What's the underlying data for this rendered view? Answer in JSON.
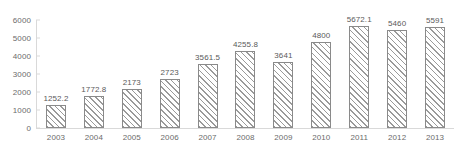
{
  "chart_data": {
    "type": "bar",
    "title": "",
    "subtitle": "",
    "xlabel": "",
    "ylabel": "",
    "categories": [
      "2003",
      "2004",
      "2005",
      "2006",
      "2007",
      "2008",
      "2009",
      "2010",
      "2011",
      "2012",
      "2013"
    ],
    "values": [
      1252.2,
      1772.8,
      2173,
      2723,
      3561.5,
      4255.8,
      3641,
      4800,
      5672.1,
      5460,
      5591
    ],
    "value_labels": [
      "1252.2",
      "1772.8",
      "2173",
      "2723",
      "3561.5",
      "4255.8",
      "3641",
      "4800",
      "5672.1",
      "5460",
      "5591"
    ],
    "series": [
      {
        "name": "",
        "values": [
          1252.2,
          1772.8,
          2173,
          2723,
          3561.5,
          4255.8,
          3641,
          4800,
          5672.1,
          5460,
          5591
        ]
      }
    ],
    "ylim": [
      0,
      6000
    ],
    "yticks": [
      0,
      1000,
      2000,
      3000,
      4000,
      5000,
      6000
    ],
    "ytick_labels": [
      "0",
      "1000",
      "2000",
      "3000",
      "4000",
      "5000",
      "6000"
    ],
    "xlim_categories": 11,
    "grid": false,
    "legend": null,
    "legend_position": "none",
    "annotations": [],
    "style": {
      "bar_fill": "#ffffff",
      "bar_hatch": "forward-diagonal",
      "bar_hatch_color": "#9a9a9a",
      "bar_border": "#8a8a8a",
      "axis_color": "#d9d9d9",
      "tick_label_color": "#6b6b6b",
      "value_label_color": "#5a5a5a",
      "background": "#ffffff"
    }
  }
}
